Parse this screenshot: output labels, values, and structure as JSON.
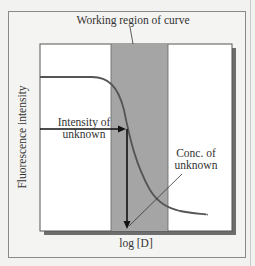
{
  "diagram": {
    "title": "Working region of curve",
    "ylabel": "Fluorescence intensity",
    "xlabel": "log [D]",
    "annotations": {
      "intensity_line1": "Intensity of",
      "intensity_line2": "unknown",
      "conc_line1": "Conc. of",
      "conc_line2": "unknown"
    },
    "colors": {
      "shaded_region": "#a5a5a5",
      "curve": "#555555",
      "arrow": "#111111",
      "plot_bg": "#ffffff"
    }
  }
}
